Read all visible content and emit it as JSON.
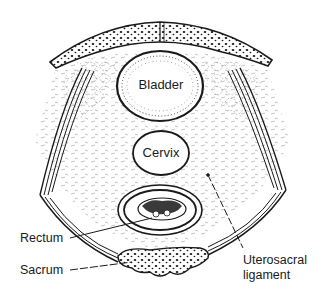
{
  "diagram": {
    "colors": {
      "ink": "#1a1a1a",
      "background": "#ffffff",
      "tissue_stipple": "#6a6a6a"
    },
    "structures": {
      "bladder": {
        "label": "Bladder"
      },
      "cervix": {
        "label": "Cervix"
      },
      "rectum": {
        "label": "Rectum"
      },
      "sacrum": {
        "label": "Sacrum"
      },
      "uterosacral_ligament": {
        "label_line1": "Uterosacral",
        "label_line2": "ligament"
      }
    }
  }
}
